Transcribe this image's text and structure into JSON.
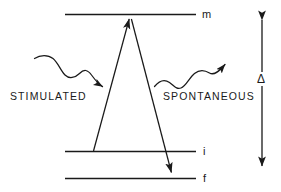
{
  "figure": {
    "kind": "energy-level-transition-diagram",
    "background_color": "#ffffff",
    "ink_color": "#1a1a1a"
  },
  "levels": [
    {
      "id": "m",
      "label": "m",
      "role": "upper-virtual-level"
    },
    {
      "id": "i",
      "label": "i",
      "role": "intermediate-initial-level"
    },
    {
      "id": "f",
      "label": "f",
      "role": "final-level"
    }
  ],
  "processes": [
    {
      "id": "stimulated",
      "label": "STIMULATED",
      "direction": "absorption-upward"
    },
    {
      "id": "spontaneous",
      "label": "SPONTANEOUS",
      "direction": "emission-outward"
    }
  ],
  "annotations": {
    "energy_gap_symbol": "Δ",
    "energy_gap_name": "delta",
    "gap_between": [
      "m",
      "i"
    ]
  }
}
